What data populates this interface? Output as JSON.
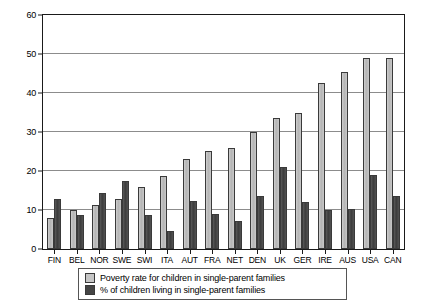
{
  "chart_data": {
    "type": "bar",
    "title": "",
    "subtitle": "",
    "xlabel": "",
    "ylabel": "",
    "ylim": [
      0,
      60
    ],
    "yticks": [
      0,
      10,
      20,
      30,
      40,
      50,
      60
    ],
    "grid": "horizontal",
    "legend_position": "bottom-center",
    "categories": [
      "FIN",
      "BEL",
      "NOR",
      "SWE",
      "SWI",
      "ITA",
      "AUT",
      "FRA",
      "NET",
      "DEN",
      "UK",
      "GER",
      "IRE",
      "AUS",
      "USA",
      "CAN"
    ],
    "series": [
      {
        "name": "Poverty rate for children in single-parent families",
        "color": "#c6c6c6",
        "values": [
          7.9,
          10.0,
          11.2,
          12.7,
          15.9,
          18.8,
          23.2,
          25.2,
          25.9,
          30.0,
          33.5,
          35.0,
          42.6,
          45.5,
          49.0,
          48.9
        ]
      },
      {
        "name": "% of children living in single-parent families",
        "color": "#454545",
        "values": [
          12.8,
          8.8,
          14.3,
          17.5,
          8.7,
          4.6,
          12.3,
          9.1,
          7.3,
          13.7,
          21.0,
          12.0,
          10.1,
          10.3,
          19.0,
          13.5
        ]
      }
    ]
  },
  "legend": {
    "items": [
      {
        "label": "Poverty rate for children in single-parent families"
      },
      {
        "label": "% of children living in single-parent families"
      }
    ]
  }
}
